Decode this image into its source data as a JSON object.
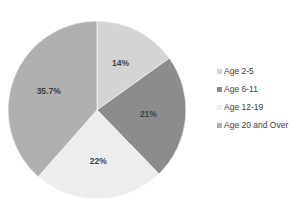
{
  "chart_data": {
    "type": "pie",
    "title": "",
    "xlabel": "",
    "ylabel": "",
    "grid": false,
    "legend_position": "right",
    "start_angle_deg": 0,
    "direction": "clockwise",
    "categories": [
      "Age 2-5",
      "Age 6-11",
      "Age 12-19",
      "Age 20 and Over"
    ],
    "values": [
      14,
      21,
      22,
      35.7
    ],
    "labels": [
      "14%",
      "21%",
      "22%",
      "35.7%"
    ],
    "colors": [
      "#d4d4d4",
      "#8c8c8c",
      "#ededed",
      "#b0b0b0"
    ]
  },
  "legend": {
    "items": [
      {
        "label": "Age 2-5",
        "color": "#d4d4d4"
      },
      {
        "label": "Age 6-11",
        "color": "#8c8c8c"
      },
      {
        "label": "Age 12-19",
        "color": "#ededed"
      },
      {
        "label": "Age 20 and Over",
        "color": "#b0b0b0"
      }
    ]
  },
  "slice_labels": {
    "s0": "14%",
    "s1": "21%",
    "s2": "22%",
    "s3": "35.7%"
  }
}
